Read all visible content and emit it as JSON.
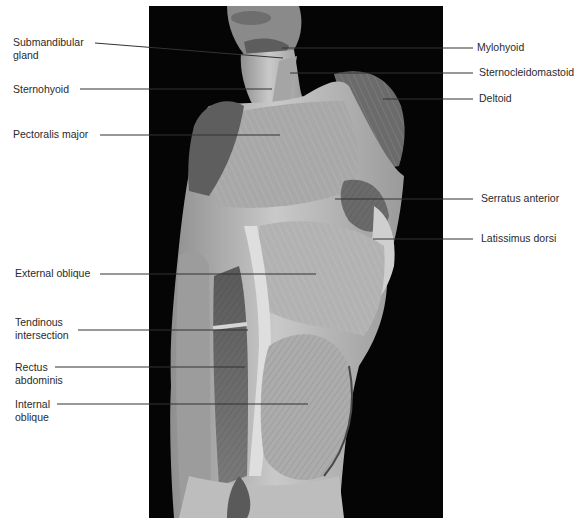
{
  "figure": {
    "photo": {
      "background_color": "#050505",
      "tissue_color": "#b8b8b8"
    },
    "leader_color": "#333333",
    "labels_left": [
      {
        "id": "submandibular-gland",
        "lines": [
          "Submandibular",
          "gland"
        ],
        "x": 13,
        "y": 36,
        "leader": [
          95,
          43,
          283,
          58
        ]
      },
      {
        "id": "sternohyoid",
        "lines": [
          "Sternohyoid"
        ],
        "x": 13,
        "y": 83,
        "leader": [
          80,
          89,
          272,
          89
        ]
      },
      {
        "id": "pectoralis-major",
        "lines": [
          "Pectoralis major"
        ],
        "x": 13,
        "y": 128,
        "leader": [
          100,
          135,
          280,
          135
        ]
      },
      {
        "id": "external-oblique",
        "lines": [
          "External oblique"
        ],
        "x": 15,
        "y": 267,
        "leader": [
          100,
          274,
          316,
          274
        ]
      },
      {
        "id": "tendinous-intersection",
        "lines": [
          "Tendinous",
          "intersection"
        ],
        "x": 15,
        "y": 316,
        "leader": [
          78,
          330,
          248,
          330
        ]
      },
      {
        "id": "rectus-abdominis",
        "lines": [
          "Rectus",
          "abdominis"
        ],
        "x": 15,
        "y": 361,
        "leader": [
          55,
          367,
          245,
          367
        ]
      },
      {
        "id": "internal-oblique",
        "lines": [
          "Internal",
          "oblique"
        ],
        "x": 15,
        "y": 398,
        "leader": [
          57,
          404,
          308,
          404
        ]
      }
    ],
    "labels_right": [
      {
        "id": "mylohyoid",
        "lines": [
          "Mylohyoid"
        ],
        "x": 477,
        "y": 41,
        "leader": [
          282,
          48,
          473,
          48
        ]
      },
      {
        "id": "sternocleidomastoid",
        "lines": [
          "Sternocleidomastoid"
        ],
        "x": 479,
        "y": 66,
        "leader": [
          290,
          73,
          473,
          73
        ]
      },
      {
        "id": "deltoid",
        "lines": [
          "Deltoid"
        ],
        "x": 479,
        "y": 92,
        "leader": [
          383,
          99,
          473,
          99
        ]
      },
      {
        "id": "serratus-anterior",
        "lines": [
          "Serratus anterior"
        ],
        "x": 481,
        "y": 192,
        "leader": [
          335,
          199,
          473,
          199
        ]
      },
      {
        "id": "latissimus-dorsi",
        "lines": [
          "Latissimus dorsi"
        ],
        "x": 481,
        "y": 232,
        "leader": [
          373,
          239,
          473,
          239
        ]
      }
    ]
  }
}
